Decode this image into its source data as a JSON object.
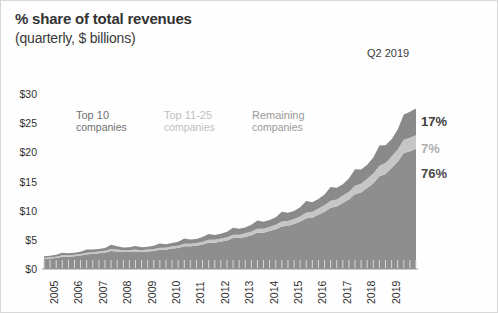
{
  "header": {
    "title": "% share of total revenues",
    "subtitle": "(quarterly, $ billions)",
    "period_note": "Q2 2019"
  },
  "chart_data": {
    "type": "area",
    "stacked": true,
    "title": "% share of total revenues",
    "subtitle": "(quarterly, $ billions)",
    "xlabel": "",
    "ylabel": "",
    "ylim": [
      0,
      30
    ],
    "yticks": [
      0,
      5,
      10,
      15,
      20,
      25,
      30
    ],
    "ytick_labels": [
      "$0",
      "$5",
      "$10",
      "$15",
      "$20",
      "$25",
      "$30"
    ],
    "grid": false,
    "legend_position": "inside-top-left",
    "x_tick_labels": [
      "2005",
      "2006",
      "2007",
      "2008",
      "2009",
      "2010",
      "2011",
      "2012",
      "2013",
      "2014",
      "2015",
      "2016",
      "2017",
      "2018",
      "2019"
    ],
    "x_start_year": 2005,
    "x_points_per_year": 4,
    "x_note": "quarterly observations, 2005 Q1 through 2019 Q2",
    "series": [
      {
        "name": "Top 10 companies",
        "label_line1": "Top 10",
        "label_line2": "companies",
        "color": "#8e8e8e",
        "end_share_label": "76%",
        "end_share_color": "#4a4a4a",
        "values": [
          1.7,
          1.8,
          1.9,
          2.1,
          2.1,
          2.2,
          2.3,
          2.5,
          2.6,
          2.7,
          2.8,
          3.1,
          3.0,
          2.9,
          2.9,
          3.0,
          2.9,
          3.0,
          3.1,
          3.3,
          3.3,
          3.5,
          3.6,
          3.9,
          3.9,
          4.0,
          4.2,
          4.5,
          4.5,
          4.7,
          4.9,
          5.3,
          5.3,
          5.5,
          5.8,
          6.2,
          6.2,
          6.5,
          6.8,
          7.3,
          7.4,
          7.7,
          8.1,
          8.7,
          8.8,
          9.3,
          9.8,
          10.5,
          10.7,
          11.3,
          11.9,
          12.8,
          13.1,
          13.9,
          14.7,
          15.9,
          16.3,
          17.3,
          18.4,
          19.9,
          20.2,
          20.6
        ]
      },
      {
        "name": "Top 11-25 companies",
        "label_line1": "Top 11-25",
        "label_line2": "companies",
        "color": "#c6c6c6",
        "end_share_label": "7%",
        "end_share_color": "#b0b0b0",
        "values": [
          0.2,
          0.21,
          0.22,
          0.24,
          0.24,
          0.25,
          0.26,
          0.28,
          0.29,
          0.3,
          0.31,
          0.34,
          0.33,
          0.32,
          0.32,
          0.33,
          0.32,
          0.33,
          0.34,
          0.36,
          0.36,
          0.38,
          0.4,
          0.43,
          0.43,
          0.45,
          0.47,
          0.5,
          0.5,
          0.52,
          0.55,
          0.59,
          0.59,
          0.62,
          0.65,
          0.7,
          0.7,
          0.73,
          0.77,
          0.83,
          0.84,
          0.88,
          0.92,
          0.99,
          1.0,
          1.06,
          1.12,
          1.2,
          1.22,
          1.29,
          1.36,
          1.46,
          1.5,
          1.59,
          1.68,
          1.82,
          1.86,
          1.97,
          2.1,
          2.27,
          2.3,
          2.35
        ]
      },
      {
        "name": "Remaining companies",
        "label_line1": "Remaining",
        "label_line2": "companies",
        "color": "#8a8a8a",
        "end_share_label": "17%",
        "end_share_color": "#3f3f3f",
        "values": [
          0.3,
          0.28,
          0.33,
          0.45,
          0.36,
          0.34,
          0.4,
          0.55,
          0.45,
          0.42,
          0.48,
          0.7,
          0.55,
          0.45,
          0.5,
          0.62,
          0.5,
          0.48,
          0.55,
          0.72,
          0.6,
          0.58,
          0.66,
          0.88,
          0.72,
          0.7,
          0.8,
          1.02,
          0.85,
          0.82,
          0.94,
          1.2,
          1.0,
          0.98,
          1.12,
          1.42,
          1.18,
          1.15,
          1.32,
          1.68,
          1.4,
          1.36,
          1.56,
          1.98,
          1.66,
          1.62,
          1.86,
          2.36,
          2.0,
          1.95,
          2.24,
          2.84,
          2.44,
          2.38,
          2.74,
          3.46,
          3.06,
          2.98,
          3.42,
          4.3,
          4.46,
          4.55
        ]
      }
    ]
  },
  "axes": {
    "y_labels": [
      "$30",
      "$25",
      "$20",
      "$15",
      "$10",
      "$5",
      "$0"
    ],
    "x_labels": [
      "2005",
      "2006",
      "2007",
      "2008",
      "2009",
      "2010",
      "2011",
      "2012",
      "2013",
      "2014",
      "2015",
      "2016",
      "2017",
      "2018",
      "2019"
    ]
  },
  "end_labels": [
    {
      "text": "17%",
      "series": "Remaining companies"
    },
    {
      "text": "7%",
      "series": "Top 11-25 companies"
    },
    {
      "text": "76%",
      "series": "Top 10 companies"
    }
  ]
}
